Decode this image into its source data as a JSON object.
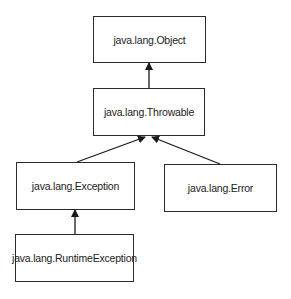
{
  "diagram": {
    "nodes": [
      {
        "id": "object",
        "label": "java.lang.Object"
      },
      {
        "id": "throwable",
        "label": "java.lang.Throwable"
      },
      {
        "id": "exception",
        "label": "java.lang.Exception"
      },
      {
        "id": "error",
        "label": "java.lang.Error"
      },
      {
        "id": "runtime",
        "label": "java.lang.RuntimeException"
      }
    ],
    "edges": [
      {
        "from": "throwable",
        "to": "object"
      },
      {
        "from": "exception",
        "to": "throwable"
      },
      {
        "from": "error",
        "to": "throwable"
      },
      {
        "from": "runtime",
        "to": "exception"
      }
    ],
    "colors": {
      "stroke": "#2a2a2a",
      "background": "#ffffff"
    }
  }
}
